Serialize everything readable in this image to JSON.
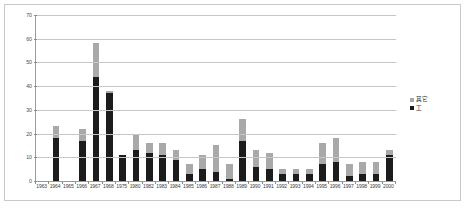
{
  "chart_data": {
    "type": "bar",
    "stacked": true,
    "title": "",
    "xlabel": "",
    "ylabel": "",
    "ylim": [
      0,
      70
    ],
    "ytick_step": 10,
    "yticks": [
      0,
      10,
      20,
      30,
      40,
      50,
      60,
      70
    ],
    "grid": true,
    "legend_position": "right",
    "categories": [
      "1963",
      "1964",
      "1965",
      "1966",
      "1967",
      "1968",
      "1975",
      "1980",
      "1982",
      "1983",
      "1984",
      "1985",
      "1986",
      "1987",
      "1988",
      "1989",
      "1990",
      "1991",
      "1992",
      "1993",
      "1994",
      "1995",
      "1996",
      "1997",
      "1998",
      "1999",
      "2000"
    ],
    "series": [
      {
        "name": "工",
        "color": "#1c1c1c",
        "values": [
          0,
          18,
          0,
          17,
          44,
          37,
          11,
          13,
          12,
          11,
          9,
          3,
          5,
          4,
          1,
          17,
          6,
          5,
          3,
          3,
          3,
          7,
          8,
          2,
          3,
          3,
          11
        ]
      },
      {
        "name": "其它",
        "color": "#a9a9a9",
        "values": [
          0,
          5,
          0,
          5,
          14,
          1,
          0,
          7,
          4,
          5,
          4,
          4,
          6,
          11,
          6,
          9,
          7,
          7,
          2,
          2,
          2,
          9,
          10,
          5,
          5,
          5,
          2
        ]
      }
    ],
    "totals": [
      0,
      23,
      0,
      22,
      58,
      38,
      11,
      20,
      16,
      16,
      13,
      7,
      11,
      15,
      7,
      26,
      13,
      12,
      5,
      5,
      5,
      16,
      18,
      7,
      8,
      8,
      13
    ]
  },
  "legend": {
    "entries": [
      {
        "label": "其它",
        "color": "#a9a9a9"
      },
      {
        "label": "工",
        "color": "#1c1c1c"
      }
    ]
  }
}
